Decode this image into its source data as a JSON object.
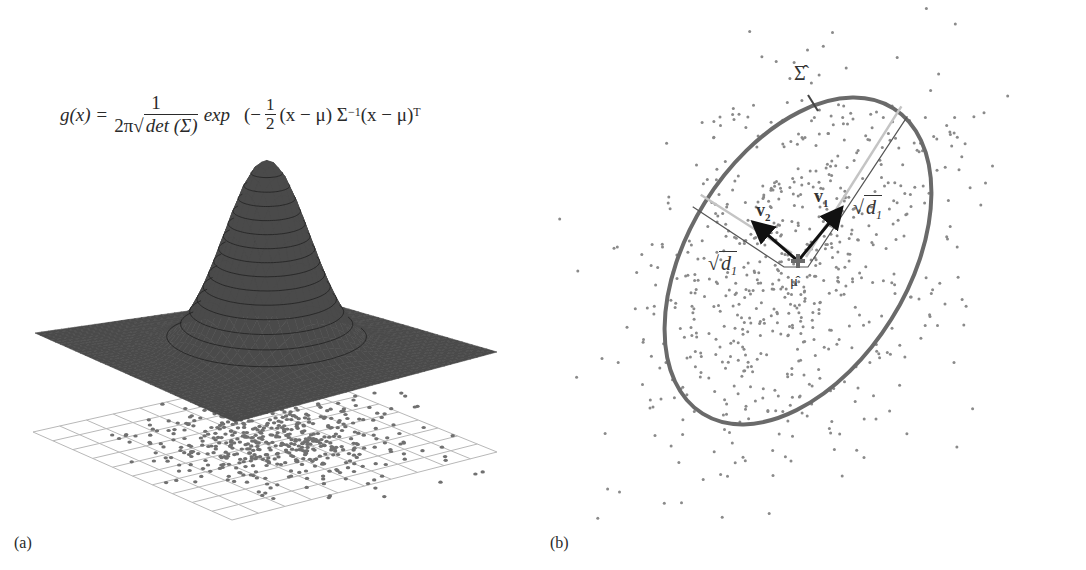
{
  "figure": {
    "panel_a": {
      "label": "(a)",
      "formula": {
        "lhs": "g(x) =",
        "numerator": "1",
        "denominator_prefix": "2π",
        "denominator_sqrt": "det (Σ)",
        "exp": "exp",
        "open_paren": "(−",
        "half_num": "1",
        "half_den": "2",
        "term1": "(x − μ) Σ",
        "inv_exp": "−1",
        "term2": "(x − μ)",
        "transpose": "T"
      },
      "surface": {
        "type": "3D Gaussian surface over grid",
        "color": "#4a4a4a",
        "contour_color": "#1e1e1e",
        "contour_count": 14
      },
      "grid": {
        "rows": 10,
        "cols": 10,
        "color": "#b8b8b8"
      },
      "scatter": {
        "count": 520,
        "color": "#707070",
        "seed": 7
      }
    },
    "panel_b": {
      "label": "(b)",
      "ellipse_label": "Σ̂",
      "mean_label": "μ̂",
      "v1_label": "v",
      "v1_sub": "1",
      "v2_label": "v",
      "v2_sub": "2",
      "sqrt_d1_right": "d",
      "sqrt_d1_right_sub": "1",
      "sqrt_d1_left": "d",
      "sqrt_d1_left_sub": "1",
      "ellipse": {
        "cx": 798,
        "cy": 261,
        "rx": 180,
        "ry": 110,
        "rotation_deg": -58,
        "color": "#6a6a6a"
      },
      "scatter": {
        "count": 700,
        "color": "#8a8a8a",
        "seed": 13
      }
    }
  }
}
